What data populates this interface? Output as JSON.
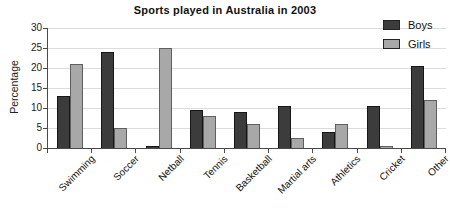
{
  "title": "Sports played in Australia in 2003",
  "legend": {
    "items": [
      {
        "label": "Boys",
        "color": "#3c3c3c",
        "border": "#161616"
      },
      {
        "label": "Girls",
        "color": "#a8a8a8",
        "border": "#5f5f5f"
      }
    ],
    "position": "top-right"
  },
  "chart_data": {
    "type": "bar",
    "title": "Sports played in Australia in 2003",
    "categories": [
      "Swimming",
      "Soccer",
      "Netball",
      "Tennis",
      "Basketball",
      "Martial arts",
      "Athletics",
      "Cricket",
      "Other"
    ],
    "series": [
      {
        "name": "Boys",
        "color": "#3c3c3c",
        "border": "#161616",
        "values": [
          13,
          24,
          0.5,
          9.5,
          9,
          10.5,
          4,
          10.5,
          20.5
        ]
      },
      {
        "name": "Girls",
        "color": "#a8a8a8",
        "border": "#5f5f5f",
        "values": [
          21,
          5,
          25,
          8,
          6,
          2.5,
          6,
          0.5,
          12
        ]
      }
    ],
    "xlabel": "",
    "ylabel": "Percentage",
    "ylim": [
      0,
      30
    ],
    "yticks": [
      0,
      5,
      10,
      15,
      20,
      25,
      30
    ],
    "grid": true,
    "gridline_color": "#dcdcdc",
    "legend_position": "top-right"
  }
}
